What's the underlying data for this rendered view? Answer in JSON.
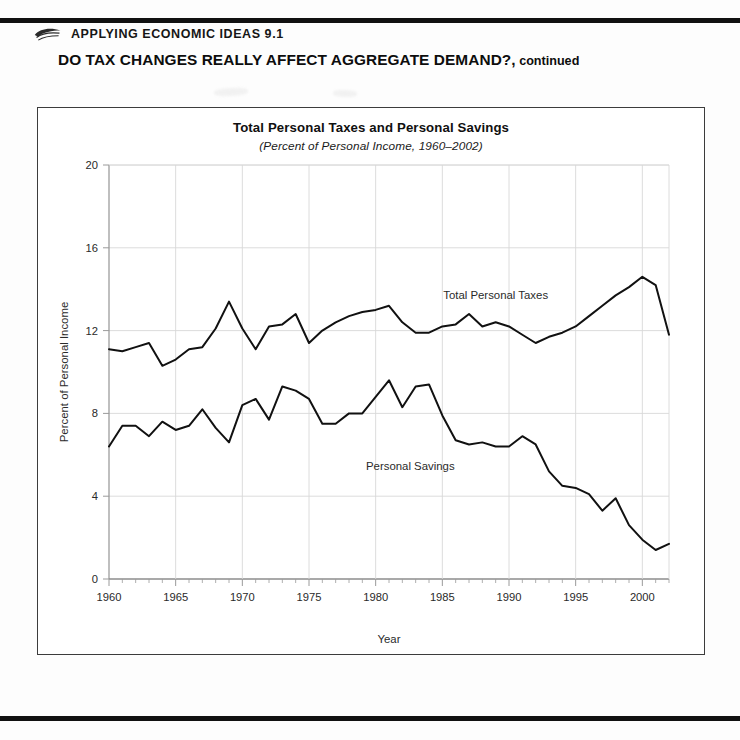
{
  "page": {
    "eyebrow": "Applying Economic Ideas 9.1",
    "headline_main": "DO TAX CHANGES REALLY AFFECT AGGREGATE DEMAND?,",
    "headline_suffix": " continued",
    "icon": "shell-swoosh-icon"
  },
  "chart_data": {
    "type": "line",
    "title": "Total Personal Taxes and Personal Savings",
    "subtitle": "(Percent of Personal Income, 1960–2002)",
    "xlabel": "Year",
    "ylabel": "Percent of Personal Income",
    "xlim": [
      1960,
      2002
    ],
    "ylim": [
      0,
      20
    ],
    "yticks": [
      0,
      4,
      8,
      12,
      16,
      20
    ],
    "xticks": [
      1960,
      1965,
      1970,
      1975,
      1980,
      1985,
      1990,
      1995,
      2000
    ],
    "xtick_labels": [
      "1960",
      "1965",
      "1970",
      "1975",
      "1980",
      "1985",
      "1990",
      "1995",
      "2000"
    ],
    "ytick_labels": [
      "0",
      "4",
      "8",
      "12",
      "16",
      "20"
    ],
    "minor_xtick_step": 1,
    "grid": "both",
    "legend": "inline-labels",
    "x": [
      1960,
      1961,
      1962,
      1963,
      1964,
      1965,
      1966,
      1967,
      1968,
      1969,
      1970,
      1971,
      1972,
      1973,
      1974,
      1975,
      1976,
      1977,
      1978,
      1979,
      1980,
      1981,
      1982,
      1983,
      1984,
      1985,
      1986,
      1987,
      1988,
      1989,
      1990,
      1991,
      1992,
      1993,
      1994,
      1995,
      1996,
      1997,
      1998,
      1999,
      2000,
      2001,
      2002
    ],
    "series": [
      {
        "name": "Total Personal Taxes",
        "label": "Total Personal Taxes",
        "color": "#111111",
        "values": [
          11.1,
          11.0,
          11.2,
          11.4,
          10.3,
          10.6,
          11.1,
          11.2,
          12.1,
          13.4,
          12.1,
          11.1,
          12.2,
          12.3,
          12.8,
          11.4,
          12.0,
          12.4,
          12.7,
          12.9,
          13.0,
          13.2,
          12.4,
          11.9,
          11.9,
          12.2,
          12.3,
          12.8,
          12.2,
          12.4,
          12.2,
          11.8,
          11.4,
          11.7,
          11.9,
          12.2,
          12.7,
          13.2,
          13.7,
          14.1,
          14.6,
          14.2,
          11.8
        ]
      },
      {
        "name": "Personal Savings",
        "label": "Personal Savings",
        "color": "#111111",
        "values": [
          6.4,
          7.4,
          7.4,
          6.9,
          7.6,
          7.2,
          7.4,
          8.2,
          7.3,
          6.6,
          8.4,
          8.7,
          7.7,
          9.3,
          9.1,
          8.7,
          7.5,
          7.5,
          8.0,
          8.0,
          8.8,
          9.6,
          8.3,
          9.3,
          9.4,
          7.9,
          6.7,
          6.5,
          6.6,
          6.4,
          6.4,
          6.9,
          6.5,
          5.2,
          4.5,
          4.4,
          4.1,
          3.3,
          3.9,
          2.6,
          1.9,
          1.4,
          1.7
        ]
      }
    ]
  }
}
